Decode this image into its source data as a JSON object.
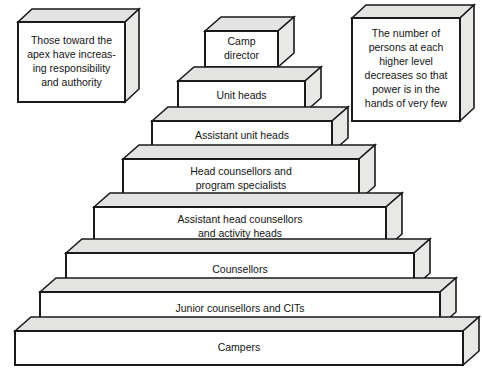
{
  "diagram": {
    "colors": {
      "background": "#ffffff",
      "front_face": "#ffffff",
      "top_face": "#e3e3e1",
      "side_face": "#e8e8e6",
      "outline": "#1a1a1a",
      "text": "#141414"
    },
    "callouts": [
      {
        "name": "left-callout",
        "lines": [
          "Those toward the",
          "apex have increas-",
          "ing responsibility",
          "and authority"
        ],
        "box": {
          "x": 18,
          "y": 22,
          "w": 107,
          "h": 80,
          "dx": 14,
          "dy": 13
        }
      },
      {
        "name": "right-callout",
        "lines": [
          "The number of",
          "persons at each",
          "higher level",
          "decreases so that",
          "power is in the",
          "hands of very few"
        ],
        "box": {
          "x": 352,
          "y": 18,
          "w": 108,
          "h": 103,
          "dx": 14,
          "dy": 13
        }
      }
    ],
    "pyramid": {
      "depth_dx": 16,
      "depth_dy": 14,
      "tiers": [
        {
          "level": 1,
          "label": "Camp director",
          "lines": [
            "Camp",
            "director"
          ],
          "x": 205,
          "y": 31,
          "w": 73,
          "h": 36
        },
        {
          "level": 2,
          "label": "Unit heads",
          "lines": [
            "Unit heads"
          ],
          "x": 178,
          "y": 81,
          "w": 127,
          "h": 31
        },
        {
          "level": 3,
          "label": "Assistant unit heads",
          "lines": [
            "Assistant unit heads"
          ],
          "x": 152,
          "y": 121,
          "w": 180,
          "h": 31
        },
        {
          "level": 4,
          "label": "Head counsellors and program specialists",
          "lines": [
            "Head counsellors and",
            "program specialists"
          ],
          "x": 123,
          "y": 159,
          "w": 236,
          "h": 41
        },
        {
          "level": 5,
          "label": "Assistant head counsellors and activity heads",
          "lines": [
            "Assistant head counsellors",
            "and activity heads"
          ],
          "x": 94,
          "y": 207,
          "w": 292,
          "h": 41
        },
        {
          "level": 6,
          "label": "Counsellors",
          "lines": [
            "Counsellors"
          ],
          "x": 66,
          "y": 253,
          "w": 348,
          "h": 34
        },
        {
          "level": 7,
          "label": "Junior counsellors and CITs",
          "lines": [
            "Junior counsellors and CITs"
          ],
          "x": 40,
          "y": 292,
          "w": 400,
          "h": 34
        },
        {
          "level": 8,
          "label": "Campers",
          "lines": [
            "Campers"
          ],
          "x": 15,
          "y": 331,
          "w": 448,
          "h": 34
        }
      ]
    }
  }
}
